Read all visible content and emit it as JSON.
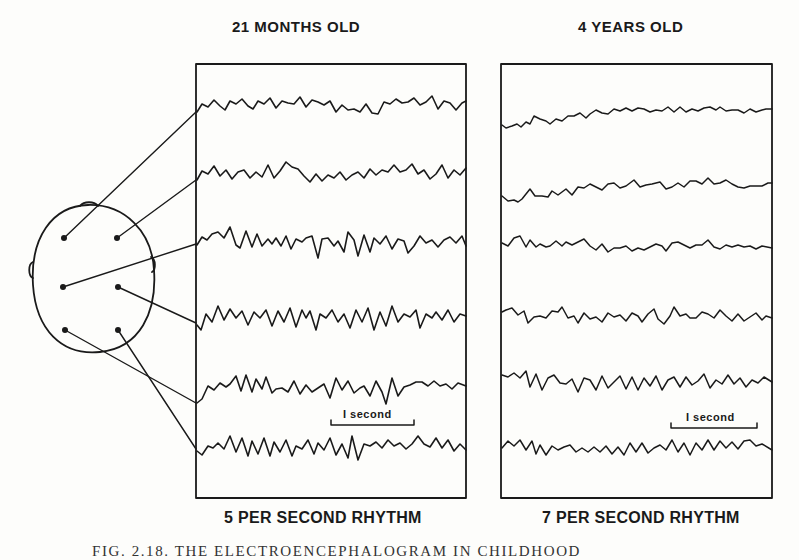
{
  "panels": [
    {
      "title": "21 MONTHS OLD",
      "rhythm_label": "5 PER SECOND RHYTHM",
      "scale_bar_label": "I second",
      "channels": 6
    },
    {
      "title": "4 YEARS OLD",
      "rhythm_label": "7 PER SECOND RHYTHM",
      "scale_bar_label": "I second",
      "channels": 6
    }
  ],
  "head_diagram": {
    "electrodes": 6,
    "description": "Top view of head with six electrode positions connected by leader lines to the six trace channels"
  },
  "caption": "FIG. 2.18. THE ELECTROENCEPHALOGRAM IN CHILDHOOD"
}
